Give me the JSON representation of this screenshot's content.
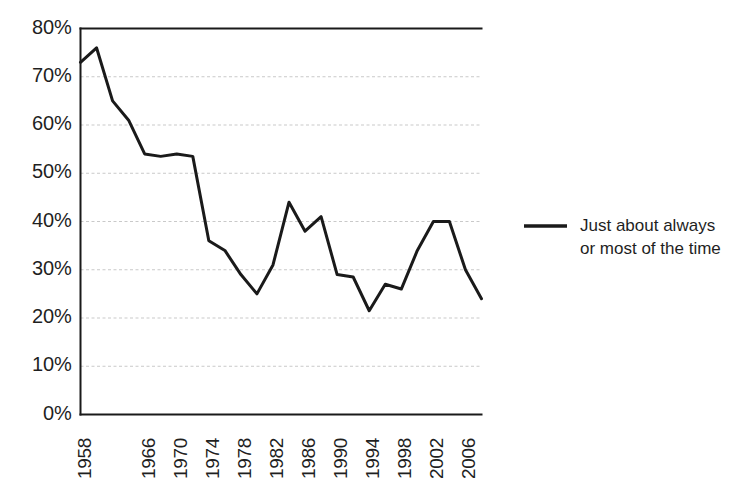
{
  "chart_data": {
    "type": "line",
    "title": "",
    "subtitle": "",
    "xlabel": "",
    "ylabel": "",
    "grid": true,
    "legend_position": "right",
    "xlim": [
      1958,
      2008
    ],
    "ylim": [
      0,
      80
    ],
    "ytick_labels": [
      "80%",
      "70%",
      "60%",
      "50%",
      "40%",
      "30%",
      "20%",
      "10%",
      "0%"
    ],
    "ytick_values": [
      80,
      70,
      60,
      50,
      40,
      30,
      20,
      10,
      0
    ],
    "xtick_labels": [
      "1958",
      "1966",
      "1970",
      "1974",
      "1978",
      "1982",
      "1986",
      "1990",
      "1994",
      "1998",
      "2002",
      "2006"
    ],
    "xtick_values": [
      1958,
      1966,
      1970,
      1974,
      1978,
      1982,
      1986,
      1990,
      1994,
      1998,
      2002,
      2006
    ],
    "series": [
      {
        "name": "Just about always or most of the time",
        "color": "#1a1a1a",
        "x": [
          1958,
          1960,
          1962,
          1964,
          1966,
          1968,
          1970,
          1972,
          1974,
          1976,
          1978,
          1980,
          1982,
          1984,
          1986,
          1988,
          1990,
          1992,
          1994,
          1996,
          1998,
          2000,
          2002,
          2004,
          2006,
          2008
        ],
        "values": [
          73,
          76,
          65,
          61,
          54,
          53.5,
          54,
          53.5,
          36,
          34,
          29,
          25,
          31,
          44,
          38,
          41,
          29,
          28.5,
          21.5,
          27,
          26,
          34,
          40,
          40,
          30,
          24
        ]
      }
    ],
    "legend": [
      {
        "label_line1": "Just about always",
        "label_line2": "or most of the time",
        "marker": "line",
        "color": "#1a1a1a"
      }
    ],
    "axis_color": "#1a1a1a",
    "gridline_color": "#c9c9c9",
    "plot_bg": "#ffffff"
  }
}
